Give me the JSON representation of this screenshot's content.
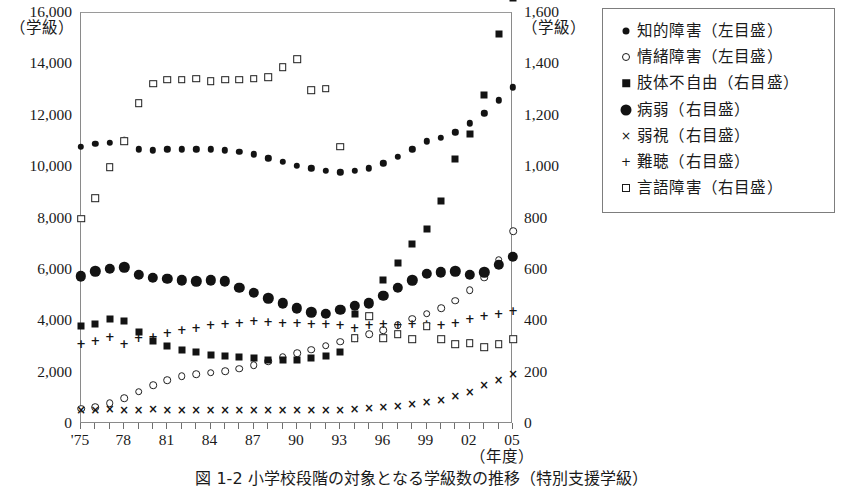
{
  "figure": {
    "caption": "図 1-2  小学校段階の対象となる学級数の推移（特別支援学級）",
    "left_axis_unit": "（学級）",
    "right_axis_unit": "（学級）",
    "x_axis_unit": "（年度）"
  },
  "legend": {
    "items": [
      {
        "marker": "filled-circle-small",
        "label": "知的障害（左目盛）",
        "axis": "left"
      },
      {
        "marker": "open-circle",
        "label": "情緒障害（左目盛）",
        "axis": "left"
      },
      {
        "marker": "filled-square",
        "label": "肢体不自由（右目盛）",
        "axis": "right"
      },
      {
        "marker": "filled-circle-large",
        "label": "病弱（右目盛）",
        "axis": "right"
      },
      {
        "marker": "cross-x",
        "label": "弱視（右目盛）",
        "axis": "right"
      },
      {
        "marker": "plus",
        "label": "難聴（右目盛）",
        "axis": "right"
      },
      {
        "marker": "open-square",
        "label": "言語障害（右目盛）",
        "axis": "right"
      }
    ]
  },
  "chart_data": {
    "type": "scatter",
    "title": "",
    "xlabel": "（年度）",
    "ylabel": "（学級）",
    "grid": false,
    "legend_position": "right",
    "x": [
      "'75",
      "76",
      "77",
      "78",
      "79",
      "80",
      "81",
      "82",
      "83",
      "84",
      "85",
      "86",
      "87",
      "88",
      "89",
      "90",
      "91",
      "92",
      "93",
      "94",
      "95",
      "96",
      "97",
      "98",
      "99",
      "00",
      "01",
      "02",
      "03",
      "04",
      "05"
    ],
    "xtick_labels": [
      "'75",
      "78",
      "81",
      "84",
      "87",
      "90",
      "93",
      "96",
      "99",
      "02",
      "05"
    ],
    "xtick_every": 3,
    "axes": {
      "left": {
        "label": "（学級）",
        "min": 0,
        "max": 16000,
        "step": 2000,
        "ticks": [
          "0",
          "2,000",
          "4,000",
          "6,000",
          "8,000",
          "10,000",
          "12,000",
          "14,000",
          "16,000"
        ]
      },
      "right": {
        "label": "（学級）",
        "min": 0,
        "max": 1600,
        "step": 200,
        "ticks": [
          "0",
          "200",
          "400",
          "600",
          "800",
          "1,000",
          "1,200",
          "1,400",
          "1,600"
        ]
      }
    },
    "series": [
      {
        "name": "知的障害（左目盛）",
        "marker": "filled-circle-small",
        "axis": "left",
        "values": [
          10800,
          10900,
          10950,
          11050,
          10700,
          10650,
          10700,
          10700,
          10700,
          10700,
          10650,
          10600,
          10500,
          10350,
          10200,
          10050,
          9950,
          9850,
          9800,
          9850,
          9950,
          10150,
          10400,
          10700,
          11000,
          11150,
          11350,
          11700,
          12100,
          12600,
          13100
        ]
      },
      {
        "name": "情緒障害（左目盛）",
        "marker": "open-circle",
        "axis": "left",
        "values": [
          600,
          650,
          800,
          1000,
          1250,
          1500,
          1700,
          1850,
          1950,
          2000,
          2050,
          2150,
          2300,
          2450,
          2600,
          2750,
          2900,
          3050,
          3200,
          3350,
          3500,
          3650,
          3850,
          4100,
          4300,
          4500,
          4800,
          5200,
          5700,
          6400,
          7500
        ]
      },
      {
        "name": "肢体不自由（右目盛）",
        "marker": "filled-square",
        "axis": "right",
        "values": [
          380,
          390,
          410,
          400,
          360,
          325,
          305,
          290,
          280,
          270,
          265,
          260,
          255,
          250,
          248,
          250,
          255,
          265,
          280,
          430,
          470,
          560,
          625,
          700,
          760,
          870,
          1030,
          1130,
          1280,
          1520,
          1660
        ]
      },
      {
        "name": "病弱（右目盛）",
        "marker": "filled-circle-large",
        "axis": "right",
        "values": [
          575,
          595,
          605,
          610,
          580,
          570,
          565,
          560,
          555,
          560,
          555,
          530,
          510,
          490,
          470,
          450,
          435,
          430,
          445,
          460,
          470,
          500,
          530,
          560,
          585,
          590,
          595,
          580,
          590,
          620,
          650
        ]
      },
      {
        "name": "弱視（右目盛）",
        "marker": "cross-x",
        "axis": "right",
        "values": [
          55,
          55,
          60,
          55,
          55,
          58,
          55,
          55,
          55,
          55,
          55,
          55,
          55,
          55,
          55,
          55,
          55,
          55,
          55,
          60,
          62,
          65,
          70,
          78,
          85,
          95,
          110,
          125,
          150,
          170,
          195
        ]
      },
      {
        "name": "難聴（右目盛）",
        "marker": "plus",
        "axis": "right",
        "values": [
          310,
          325,
          340,
          310,
          335,
          340,
          355,
          365,
          375,
          385,
          390,
          395,
          400,
          398,
          395,
          395,
          390,
          390,
          385,
          375,
          385,
          390,
          385,
          390,
          388,
          385,
          395,
          410,
          420,
          430,
          440
        ]
      },
      {
        "name": "言語障害（右目盛）",
        "marker": "open-square",
        "axis": "right",
        "values": [
          800,
          880,
          1000,
          1100,
          1250,
          1325,
          1340,
          1340,
          1345,
          1335,
          1340,
          1340,
          1345,
          1350,
          1390,
          1420,
          1300,
          1305,
          1080,
          335,
          420,
          335,
          350,
          330,
          380,
          330,
          310,
          315,
          300,
          310,
          330
        ]
      }
    ]
  }
}
